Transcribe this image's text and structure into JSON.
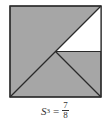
{
  "figure": {
    "colors": {
      "shaded": "#a6a6a6",
      "unshaded": "#ffffff",
      "stroke": "#2a2a2a"
    }
  },
  "caption": {
    "variable": "S",
    "subscript": "3",
    "equals": "=",
    "numerator": "7",
    "denominator": "8"
  }
}
